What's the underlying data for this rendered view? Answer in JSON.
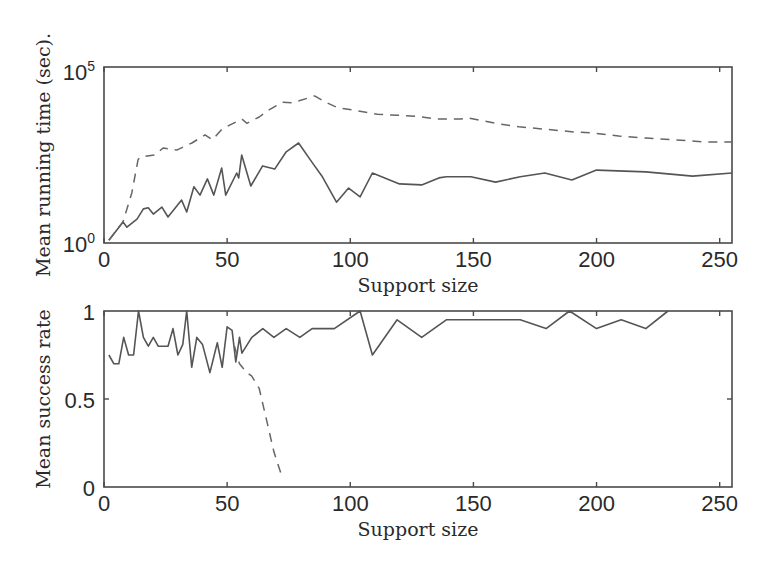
{
  "chart_data": [
    {
      "type": "line",
      "title": "",
      "xlabel": "Support size",
      "ylabel": "Mean running time (sec).",
      "yscale": "log",
      "xlim": [
        0,
        255
      ],
      "ylim": [
        1,
        100000
      ],
      "xticks": [
        "0",
        "50",
        "100",
        "150",
        "200",
        "250"
      ],
      "yticks": [
        {
          "base": "10",
          "exp": "0"
        },
        {
          "base": "10",
          "exp": "5"
        }
      ],
      "grid": false,
      "legend": null,
      "series": [
        {
          "name": "solid",
          "style": "solid",
          "x": [
            2,
            7.7,
            9.3,
            13.4,
            16,
            18,
            20,
            23.5,
            26,
            31.5,
            33.6,
            36.5,
            39,
            42,
            44.6,
            47.8,
            49.4,
            53.9,
            54.7,
            55.9,
            59.6,
            64.4,
            69.3,
            74,
            79,
            84.7,
            88.7,
            94.4,
            99.3,
            104,
            109,
            120,
            129,
            136,
            139,
            149,
            159,
            169,
            179,
            190,
            200,
            220,
            239,
            255
          ],
          "log10_values": [
            0.08,
            0.6,
            0.45,
            0.68,
            0.97,
            1.0,
            0.82,
            1.02,
            0.74,
            1.22,
            0.88,
            1.6,
            1.36,
            1.82,
            1.36,
            2.13,
            1.36,
            1.99,
            1.85,
            2.5,
            1.62,
            2.19,
            2.1,
            2.59,
            2.84,
            2.27,
            1.88,
            1.16,
            1.56,
            1.31,
            1.99,
            1.68,
            1.65,
            1.85,
            1.88,
            1.88,
            1.73,
            1.88,
            1.99,
            1.79,
            2.07,
            2.02,
            1.9,
            1.99
          ]
        },
        {
          "name": "dashed",
          "style": "dashed",
          "x": [
            2,
            7.7,
            11.3,
            13.8,
            14.6,
            20.7,
            24,
            29.5,
            35.7,
            41,
            44,
            48,
            51,
            56,
            58,
            63,
            67,
            72.5,
            76.6,
            85.5,
            90,
            95,
            101,
            111,
            127,
            135,
            145,
            148,
            159,
            168.5,
            178,
            191.6,
            198,
            209,
            220,
            232,
            244,
            255
          ],
          "log10_values": [
            0.08,
            0.6,
            1.42,
            2.36,
            2.44,
            2.5,
            2.7,
            2.64,
            2.84,
            3.07,
            2.93,
            3.24,
            3.35,
            3.52,
            3.4,
            3.58,
            3.78,
            4.0,
            3.98,
            4.18,
            4.0,
            3.84,
            3.78,
            3.66,
            3.6,
            3.52,
            3.52,
            3.55,
            3.4,
            3.3,
            3.24,
            3.15,
            3.13,
            3.04,
            2.98,
            2.93,
            2.87,
            2.87
          ]
        }
      ]
    },
    {
      "type": "line",
      "title": "",
      "xlabel": "Support size",
      "ylabel": "Mean success rate",
      "xlim": [
        0,
        255
      ],
      "ylim": [
        0,
        1
      ],
      "xticks": [
        "0",
        "50",
        "100",
        "150",
        "200",
        "250"
      ],
      "yticks": [
        "0",
        "0.5",
        "1"
      ],
      "grid": false,
      "legend": null,
      "series": [
        {
          "name": "solid",
          "style": "solid",
          "x": [
            2,
            4,
            6,
            8,
            10,
            12,
            14,
            16,
            18,
            20,
            22,
            26,
            28,
            30,
            32,
            33.6,
            35.6,
            37.7,
            40,
            43,
            46,
            48,
            50,
            52,
            53.5,
            55,
            56,
            60,
            64.5,
            69,
            74,
            79.5,
            84.5,
            93.5,
            104,
            109,
            119,
            129,
            139,
            169,
            179.5,
            189,
            200,
            210,
            220,
            229
          ],
          "values": [
            0.75,
            0.7,
            0.7,
            0.85,
            0.75,
            0.75,
            1.0,
            0.85,
            0.8,
            0.85,
            0.8,
            0.8,
            0.9,
            0.75,
            0.81,
            1.0,
            0.68,
            0.85,
            0.81,
            0.65,
            0.82,
            0.68,
            0.91,
            0.89,
            0.71,
            0.85,
            0.76,
            0.85,
            0.9,
            0.85,
            0.9,
            0.85,
            0.9,
            0.9,
            1.0,
            0.75,
            0.95,
            0.85,
            0.95,
            0.95,
            0.9,
            1.0,
            0.9,
            0.95,
            0.9,
            1.0
          ]
        },
        {
          "name": "dashed",
          "style": "dashed",
          "x": [
            53,
            55,
            58,
            60,
            63,
            66.5,
            69,
            72.5
          ],
          "values": [
            0.8,
            0.7,
            0.65,
            0.63,
            0.56,
            0.35,
            0.2,
            0.05
          ]
        }
      ]
    }
  ],
  "plots": {
    "top": {
      "ylabel": "Mean running time (sec).",
      "xlabel": "Support size",
      "ytick_hi_base": "10",
      "ytick_hi_exp": "5",
      "ytick_lo_base": "10",
      "ytick_lo_exp": "0",
      "xticks": [
        "0",
        "50",
        "100",
        "150",
        "200",
        "250"
      ]
    },
    "bottom": {
      "ylabel": "Mean success rate",
      "xlabel": "Support size",
      "yticks": [
        "1",
        "0.5",
        "0"
      ],
      "xticks": [
        "0",
        "50",
        "100",
        "150",
        "200",
        "250"
      ]
    }
  }
}
